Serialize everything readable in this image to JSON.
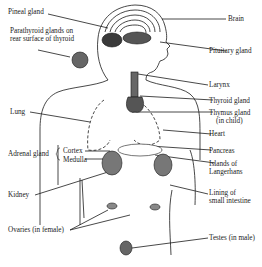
{
  "labels": {
    "pineal": "Pineal gland",
    "parathyroid_1": "Parathyroid glands on",
    "parathyroid_2": "rear surface of thyroid",
    "brain": "Brain",
    "pituitary": "Pituitary gland",
    "larynx": "Larynx",
    "thyroid": "Thyroid gland",
    "thymus_1": "Thymus gland",
    "thymus_2": "(in child)",
    "lung": "Lung",
    "heart": "Heart",
    "adrenal": "Adrenal gland",
    "cortex": "Cortex",
    "medulla": "Medulla",
    "pancreas": "Pancreas",
    "islands_1": "Islands of",
    "islands_2": "Langerhans",
    "kidney": "Kidney",
    "lining_1": "Lining of",
    "lining_2": "small intestine",
    "ovaries": "Ovaries (in female)",
    "testes": "Testes (in male)"
  },
  "colors": {
    "ink": "#1a1a1a",
    "background": "#ffffff"
  }
}
